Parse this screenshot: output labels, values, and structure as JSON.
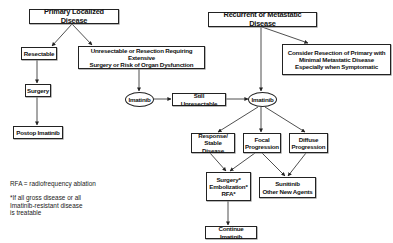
{
  "diagram": {
    "type": "flowchart",
    "nodes": {
      "primary_localized": {
        "label": "Primary Localized Disease"
      },
      "resectable": {
        "label": "Resectable"
      },
      "unresectable": {
        "line1": "Unresectable or Resection Requiring Extensive",
        "line2": "Surgery or Risk of Organ Dysfunction"
      },
      "surgery": {
        "label": "Surgery"
      },
      "postop_imatinib": {
        "label": "Postop Imatinib"
      },
      "imatinib_left": {
        "label": "Imatinib"
      },
      "still_unresectable": {
        "label": "Still Unresectable"
      },
      "recurrent_metastatic": {
        "label": "Recurrent or Metastatic Disease"
      },
      "consider_resection": {
        "line1": "Consider Resection of Primary with",
        "line2": "Minimal Metastatic Disease",
        "line3": "Especially when Symptomatic"
      },
      "imatinib_right": {
        "label": "Imatinib"
      },
      "response_stable": {
        "line1": "Response/",
        "line2": "Stable Disease"
      },
      "focal_progression": {
        "line1": "Focal",
        "line2": "Progression"
      },
      "diffuse_progression": {
        "line1": "Diffuse",
        "line2": "Progression"
      },
      "local_therapy": {
        "line1": "Surgery*",
        "line2": "Embolization*",
        "line3": "RFA*"
      },
      "sunitinib": {
        "line1": "Sunitinib",
        "line2": "Other New Agents"
      },
      "continue_imatinib": {
        "label": "Continue Imatinib"
      }
    },
    "edges": [
      [
        "primary_localized",
        "resectable"
      ],
      [
        "primary_localized",
        "unresectable"
      ],
      [
        "resectable",
        "surgery"
      ],
      [
        "surgery",
        "postop_imatinib"
      ],
      [
        "unresectable",
        "imatinib_left"
      ],
      [
        "imatinib_left",
        "still_unresectable"
      ],
      [
        "still_unresectable",
        "imatinib_right"
      ],
      [
        "recurrent_metastatic",
        "imatinib_right"
      ],
      [
        "recurrent_metastatic",
        "consider_resection"
      ],
      [
        "imatinib_right",
        "response_stable"
      ],
      [
        "imatinib_right",
        "focal_progression"
      ],
      [
        "imatinib_right",
        "diffuse_progression"
      ],
      [
        "response_stable",
        "local_therapy"
      ],
      [
        "focal_progression",
        "local_therapy"
      ],
      [
        "focal_progression",
        "sunitinib"
      ],
      [
        "diffuse_progression",
        "sunitinib"
      ],
      [
        "local_therapy",
        "continue_imatinib"
      ]
    ]
  },
  "notes": {
    "rfa": "RFA = radiofrequency ablation",
    "footnote_line1": "*If all gross disease or all",
    "footnote_line2": "Imatinib-resistant disease",
    "footnote_line3": "is treatable"
  }
}
